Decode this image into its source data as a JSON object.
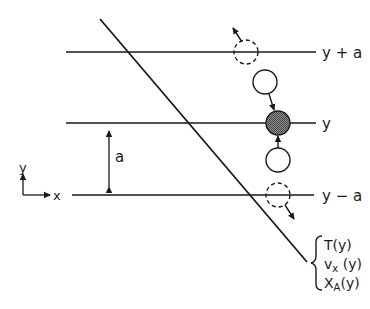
{
  "diagram": {
    "type": "physics-schematic",
    "colors": {
      "ink": "#1a1a1a",
      "shaded_fill": "#6e6e6e",
      "background": "#ffffff"
    },
    "levels": [
      {
        "id": "upper",
        "label": "y + a",
        "ypx": 52
      },
      {
        "id": "middle",
        "label": "y",
        "ypx": 123
      },
      {
        "id": "lower",
        "label": "y − a",
        "ypx": 195
      }
    ],
    "spacing": {
      "label": "a"
    },
    "axes": {
      "x_label": "x",
      "y_label": "y"
    },
    "profile_labels": {
      "line1": "T(y)",
      "line2_main": "v",
      "line2_sub": "x",
      "line2_tail": " (y)",
      "line3_main": "X",
      "line3_sub": "A",
      "line3_tail": "(y)"
    },
    "particles": [
      {
        "id": "departing-upper",
        "style": "dashed",
        "cx": 246,
        "cy": 52
      },
      {
        "id": "arriving-from-above",
        "style": "open",
        "cx": 265,
        "cy": 82
      },
      {
        "id": "reference",
        "style": "shaded",
        "cx": 278,
        "cy": 123
      },
      {
        "id": "arriving-from-below",
        "style": "open",
        "cx": 278,
        "cy": 160
      },
      {
        "id": "departing-lower",
        "style": "dashed",
        "cx": 278,
        "cy": 195
      }
    ]
  }
}
